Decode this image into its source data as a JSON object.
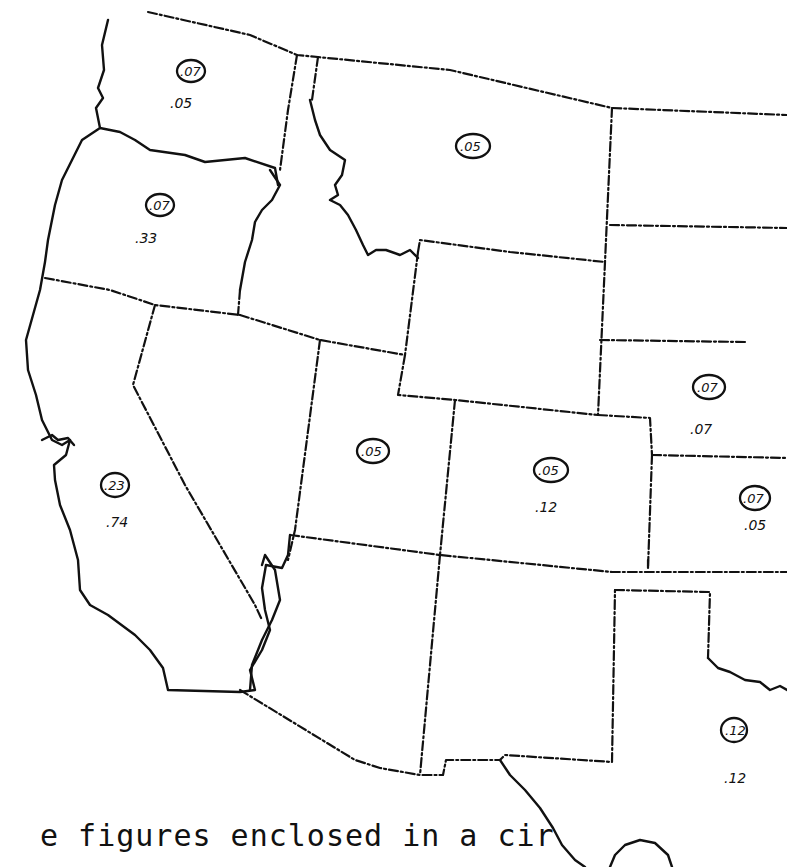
{
  "map": {
    "type": "choropleth-annotated",
    "region": "Western United States",
    "legend_note": "figures enclosed in a circle (partial)",
    "caption": "e figures enclosed in a cir",
    "states": [
      {
        "name": "Washington",
        "circled": ".07",
        "plain": ".05"
      },
      {
        "name": "Oregon",
        "circled": ".07",
        "plain": ".33"
      },
      {
        "name": "California",
        "circled": ".23",
        "plain": ".74"
      },
      {
        "name": "Montana",
        "circled": ".05",
        "plain": ""
      },
      {
        "name": "Utah",
        "circled": ".05",
        "plain": ""
      },
      {
        "name": "Colorado",
        "circled": ".05",
        "plain": ".12"
      },
      {
        "name": "Nebraska",
        "circled": ".07",
        "plain": ".07"
      },
      {
        "name": "Kansas",
        "circled": ".07",
        "plain": ".05"
      },
      {
        "name": "Texas",
        "circled": ".12",
        "plain": ".12"
      },
      {
        "name": "Idaho",
        "circled": "",
        "plain": ""
      },
      {
        "name": "Nevada",
        "circled": "",
        "plain": ""
      },
      {
        "name": "Wyoming",
        "circled": "",
        "plain": ""
      },
      {
        "name": "Arizona",
        "circled": "",
        "plain": ""
      },
      {
        "name": "New Mexico",
        "circled": "",
        "plain": ""
      },
      {
        "name": "North Dakota",
        "circled": "",
        "plain": ""
      },
      {
        "name": "South Dakota",
        "circled": "",
        "plain": ""
      },
      {
        "name": "Oklahoma",
        "circled": "",
        "plain": ""
      }
    ]
  },
  "labels": {
    "wa_c": ".07",
    "wa_p": ".05",
    "or_c": ".07",
    "or_p": ".33",
    "ca_c": ".23",
    "ca_p": ".74",
    "mt_c": ".05",
    "ut_c": ".05",
    "co_c": ".05",
    "co_p": ".12",
    "ne_c": ".07",
    "ne_p": ".07",
    "ks_c": ".07",
    "ks_p": ".05",
    "tx_c": ".12",
    "tx_p": ".12"
  }
}
